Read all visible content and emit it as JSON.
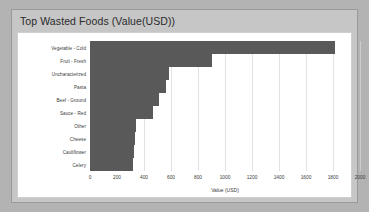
{
  "card": {
    "title": "Top Wasted Foods (Value(USD))"
  },
  "colors": {
    "bar": "#595959",
    "page_background": "#b3b3b3",
    "card_background": "#c6c6c6",
    "plot_background": "#ffffff",
    "gridline": "#e2e2e2",
    "text": "#3b3b3b"
  },
  "chart_data": {
    "type": "bar",
    "orientation": "horizontal",
    "title": "Top Wasted Foods (Value(USD))",
    "xlabel": "Value (USD)",
    "ylabel": "",
    "xlim": [
      0,
      2000
    ],
    "xticks": [
      0,
      200,
      400,
      600,
      800,
      1000,
      1200,
      1400,
      1600,
      1800,
      2000
    ],
    "xtick_labels": [
      "0",
      "200",
      "400",
      "600",
      "800",
      "1000",
      "1200",
      "1400",
      "1600",
      "1800",
      "2000"
    ],
    "grid": true,
    "grid_axis": "x",
    "legend": false,
    "categories": [
      "Vegetable - Cold",
      "Fruit - Fresh",
      "Uncharacterized",
      "Pasta",
      "Beef - Ground",
      "Sauce - Red",
      "Other",
      "Cheese",
      "Cauliflower",
      "Celery"
    ],
    "values": [
      1815,
      900,
      585,
      563,
      511,
      467,
      341,
      333,
      326,
      319
    ],
    "series": [
      {
        "name": "Value (USD)",
        "values": [
          1815,
          900,
          585,
          563,
          511,
          467,
          341,
          333,
          326,
          319
        ]
      }
    ]
  }
}
